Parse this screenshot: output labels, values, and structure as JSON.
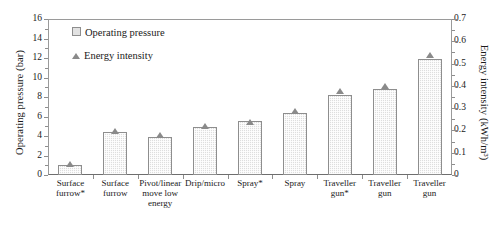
{
  "chart_data": {
    "type": "bar",
    "title": "",
    "xlabel": "",
    "ylabel": "Operating pressure (bar)",
    "y2label": "Energy intensity (kWh/m³)",
    "categories": [
      "Surface furrow*",
      "Surface furrow",
      "Pivot/linear move low energy",
      "Drip/micro",
      "Spray*",
      "Spray",
      "Traveller gun*",
      "Traveller gun",
      "Traveller gun"
    ],
    "category_lines": [
      [
        "Surface",
        "furrow*"
      ],
      [
        "Surface",
        "furrow"
      ],
      [
        "Pivot/linear",
        "move low",
        "energy"
      ],
      [
        "Drip/micro"
      ],
      [
        "Spray*"
      ],
      [
        "Spray"
      ],
      [
        "Traveller",
        "gun*"
      ],
      [
        "Traveller",
        "gun"
      ],
      [
        "Traveller",
        "gun"
      ]
    ],
    "series": [
      {
        "name": "Operating pressure",
        "axis": "left",
        "type": "bar",
        "values": [
          1.0,
          4.4,
          3.9,
          4.9,
          5.5,
          6.4,
          8.2,
          8.8,
          11.9
        ]
      },
      {
        "name": "Energy intensity",
        "axis": "right",
        "type": "marker",
        "values": [
          0.04,
          0.19,
          0.17,
          0.21,
          0.23,
          0.28,
          0.37,
          0.39,
          0.53
        ]
      }
    ],
    "ylim": [
      0,
      16
    ],
    "yticks": [
      0,
      2,
      4,
      6,
      8,
      10,
      12,
      14,
      16
    ],
    "y2lim": [
      0,
      0.7
    ],
    "y2ticks": [
      "0",
      "0.1",
      "0.2",
      "0.3",
      "0.4",
      "0.5",
      "0.6",
      "0.7"
    ],
    "y2ticks_values": [
      0,
      0.1,
      0.2,
      0.3,
      0.4,
      0.5,
      0.6,
      0.7
    ],
    "grid": false,
    "legend_position": "upper-left-inside",
    "legend": [
      {
        "label": "Operating pressure",
        "marker": "square"
      },
      {
        "label": "Energy intensity",
        "marker": "triangle"
      }
    ],
    "colors": {
      "bar_fill": "#dedede",
      "bar_edge": "#8e8e8e",
      "marker": "#8a8a8a",
      "axis": "#8d8d8d",
      "text": "#1a1a1a"
    }
  }
}
